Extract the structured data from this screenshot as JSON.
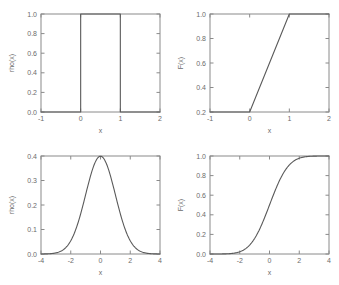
{
  "figure": {
    "background": "#ffffff",
    "axis_color": "#8a8a8a",
    "curve_color": "#5a5a5a",
    "text_color": "#6b6b6b"
  },
  "panels": [
    {
      "id": "top-left",
      "xlabel": "x",
      "ylabel": "rho(x)",
      "xticks": [
        "-1",
        "0",
        "1",
        "2"
      ],
      "yticks": [
        "0.0",
        "0.2",
        "0.4",
        "0.6",
        "0.8",
        "1.0"
      ]
    },
    {
      "id": "top-right",
      "xlabel": "x",
      "ylabel": "F(x)",
      "xticks": [
        "-1",
        "0",
        "1",
        "2"
      ],
      "yticks": [
        "0.2",
        "0.2",
        "0.4",
        "0.6",
        "0.8",
        "1.0"
      ]
    },
    {
      "id": "bottom-left",
      "xlabel": "x",
      "ylabel": "rho(x)",
      "xticks": [
        "-4",
        "-2",
        "0",
        "2",
        "4"
      ],
      "yticks": [
        "0.0",
        "0.1",
        "0.2",
        "0.3",
        "0.4"
      ]
    },
    {
      "id": "bottom-right",
      "xlabel": "x",
      "ylabel": "F(x)",
      "xticks": [
        "-4",
        "-2",
        "0",
        "2",
        "4"
      ],
      "yticks": [
        "0.0",
        "0.2",
        "0.4",
        "0.6",
        "0.8",
        "1.0"
      ]
    }
  ],
  "chart_data": [
    {
      "type": "line",
      "id": "uniform-pdf",
      "title": "",
      "xlabel": "x",
      "ylabel": "rho(x)",
      "xlim": [
        -1,
        2
      ],
      "ylim": [
        0,
        1
      ],
      "xticks": [
        -1,
        0,
        1,
        2
      ],
      "yticks": [
        0.0,
        0.2,
        0.4,
        0.6,
        0.8,
        1.0
      ],
      "grid": false,
      "legend": "none",
      "series": [
        {
          "name": "rho(x) uniform on [0,1]",
          "x": [
            -1,
            0,
            0,
            1,
            1,
            2
          ],
          "y": [
            0,
            0,
            1,
            1,
            0,
            0
          ]
        }
      ]
    },
    {
      "type": "line",
      "id": "uniform-cdf",
      "title": "",
      "xlabel": "x",
      "ylabel": "F(x)",
      "xlim": [
        -1,
        2
      ],
      "ylim": [
        0.2,
        1.0
      ],
      "xticks": [
        -1,
        0,
        1,
        2
      ],
      "yticks": [
        0.2,
        0.4,
        0.6,
        0.8,
        1.0
      ],
      "grid": false,
      "legend": "none",
      "series": [
        {
          "name": "F(x) uniform on [0,1]",
          "x": [
            -1,
            0,
            1,
            2
          ],
          "y": [
            0.2,
            0.2,
            1.0,
            1.0
          ]
        }
      ]
    },
    {
      "type": "line",
      "id": "normal-pdf",
      "title": "",
      "xlabel": "x",
      "ylabel": "rho(x)",
      "xlim": [
        -4,
        4
      ],
      "ylim": [
        0,
        0.4
      ],
      "xticks": [
        -4,
        -2,
        0,
        2,
        4
      ],
      "yticks": [
        0.0,
        0.1,
        0.2,
        0.3,
        0.4
      ],
      "grid": false,
      "legend": "none",
      "series": [
        {
          "name": "standard normal pdf",
          "x": [
            -4,
            -3.5,
            -3,
            -2.5,
            -2,
            -1.5,
            -1,
            -0.5,
            0,
            0.5,
            1,
            1.5,
            2,
            2.5,
            3,
            3.5,
            4
          ],
          "y": [
            0.0001,
            0.0009,
            0.0044,
            0.0175,
            0.054,
            0.1295,
            0.242,
            0.3521,
            0.3989,
            0.3521,
            0.242,
            0.1295,
            0.054,
            0.0175,
            0.0044,
            0.0009,
            0.0001
          ]
        }
      ]
    },
    {
      "type": "line",
      "id": "normal-cdf",
      "title": "",
      "xlabel": "x",
      "ylabel": "F(x)",
      "xlim": [
        -4,
        4
      ],
      "ylim": [
        0,
        1
      ],
      "xticks": [
        -4,
        -2,
        0,
        2,
        4
      ],
      "yticks": [
        0.0,
        0.2,
        0.4,
        0.6,
        0.8,
        1.0
      ],
      "grid": false,
      "legend": "none",
      "series": [
        {
          "name": "standard normal cdf",
          "x": [
            -4,
            -3.5,
            -3,
            -2.5,
            -2,
            -1.5,
            -1,
            -0.5,
            0,
            0.5,
            1,
            1.5,
            2,
            2.5,
            3,
            3.5,
            4
          ],
          "y": [
            3e-05,
            0.0002,
            0.0013,
            0.0062,
            0.0228,
            0.0668,
            0.1587,
            0.3085,
            0.5,
            0.6915,
            0.8413,
            0.9332,
            0.9772,
            0.9938,
            0.9987,
            0.9998,
            1.0
          ]
        }
      ]
    }
  ]
}
